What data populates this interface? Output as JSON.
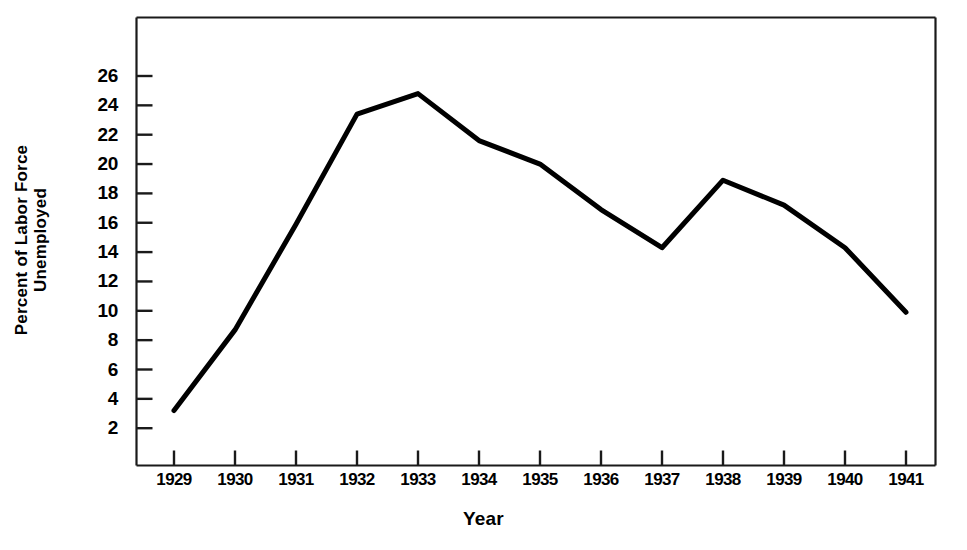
{
  "chart_data": {
    "type": "line",
    "title": "",
    "xlabel": "Year",
    "ylabel_line1": "Percent of Labor Force",
    "ylabel_line2": "Unemployed",
    "categories": [
      "1929",
      "1930",
      "1931",
      "1932",
      "1933",
      "1934",
      "1935",
      "1936",
      "1937",
      "1938",
      "1939",
      "1940",
      "1941"
    ],
    "values": [
      3.2,
      8.7,
      15.9,
      23.4,
      24.8,
      21.6,
      20.0,
      16.9,
      14.3,
      18.9,
      17.2,
      14.3,
      9.9
    ],
    "series": [
      {
        "name": "Percent of Labor Force Unemployed",
        "values": [
          3.2,
          8.7,
          15.9,
          23.4,
          24.8,
          21.6,
          20.0,
          16.9,
          14.3,
          18.9,
          17.2,
          14.3,
          9.9
        ]
      }
    ],
    "ylim": [
      0,
      27.5
    ],
    "xlim": [
      "1929",
      "1941"
    ],
    "yticks": [
      2,
      4,
      6,
      8,
      10,
      12,
      14,
      16,
      18,
      20,
      22,
      24,
      26
    ],
    "ytick_labels": [
      "2",
      "4",
      "6",
      "8",
      "10",
      "12",
      "14",
      "16",
      "18",
      "20",
      "22",
      "24",
      "26"
    ],
    "xticks": [
      "1929",
      "1930",
      "1931",
      "1932",
      "1933",
      "1934",
      "1935",
      "1936",
      "1937",
      "1938",
      "1939",
      "1940",
      "1941"
    ],
    "grid": false,
    "legend": false,
    "legend_position": "none",
    "line_color": "#000000",
    "line_width": 5,
    "frame_color": "#1a1a1a",
    "background_color": "#ffffff"
  }
}
